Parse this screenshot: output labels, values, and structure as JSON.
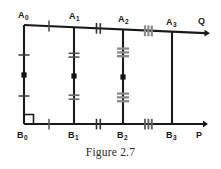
{
  "figure": {
    "caption": "Figure 2.7",
    "type": "geometry-diagram",
    "stroke_color": "#1a1a1a",
    "tick_gray_color": "#8a8a8a",
    "background_color": "#ffffff"
  },
  "labels": {
    "a0": {
      "base": "A",
      "sub": "0"
    },
    "a1": {
      "base": "A",
      "sub": "1"
    },
    "a2": {
      "base": "A",
      "sub": "2"
    },
    "a3": {
      "base": "A",
      "sub": "3"
    },
    "b0": {
      "base": "B",
      "sub": "0"
    },
    "b1": {
      "base": "B",
      "sub": "1"
    },
    "b2": {
      "base": "B",
      "sub": "2"
    },
    "b3": {
      "base": "B",
      "sub": "3"
    },
    "q": "Q",
    "p": "P"
  },
  "geometry": {
    "top_ray": {
      "from": [
        24,
        25
      ],
      "to": [
        208,
        33
      ],
      "arrow": true,
      "endpoint_label": "Q"
    },
    "bottom_ray": {
      "from": [
        24,
        124
      ],
      "to": [
        206,
        124
      ],
      "arrow": true,
      "endpoint_label": "P"
    },
    "verticals": [
      {
        "name": "A0B0",
        "x_top": 24,
        "y_top": 25,
        "x_bottom": 24,
        "y_bottom": 124,
        "ticks": 1,
        "midpoint_dot": true
      },
      {
        "name": "A1B1",
        "x_top": 74,
        "y_top": 27,
        "x_bottom": 74,
        "y_bottom": 124,
        "ticks": 2,
        "midpoint_dot": true
      },
      {
        "name": "A2B2",
        "x_top": 123,
        "y_top": 30,
        "x_bottom": 123,
        "y_bottom": 124,
        "ticks": 3,
        "midpoint_dot": true
      },
      {
        "name": "A3B3",
        "x_top": 172,
        "y_top": 32,
        "x_bottom": 172,
        "y_bottom": 124,
        "ticks": 0,
        "midpoint_dot": false
      }
    ],
    "top_segment_ticks": [
      {
        "between": "A0-A1",
        "count": 1
      },
      {
        "between": "A1-A2",
        "count": 2
      },
      {
        "between": "A2-A3",
        "count": 3
      }
    ],
    "bottom_segment_ticks": [
      {
        "between": "B0-B1",
        "count": 1
      },
      {
        "between": "B1-B2",
        "count": 2
      },
      {
        "between": "B2-B3",
        "count": 3
      }
    ],
    "right_angle_marker": {
      "at": "B0",
      "x": 24,
      "y": 124,
      "size": 9
    }
  }
}
